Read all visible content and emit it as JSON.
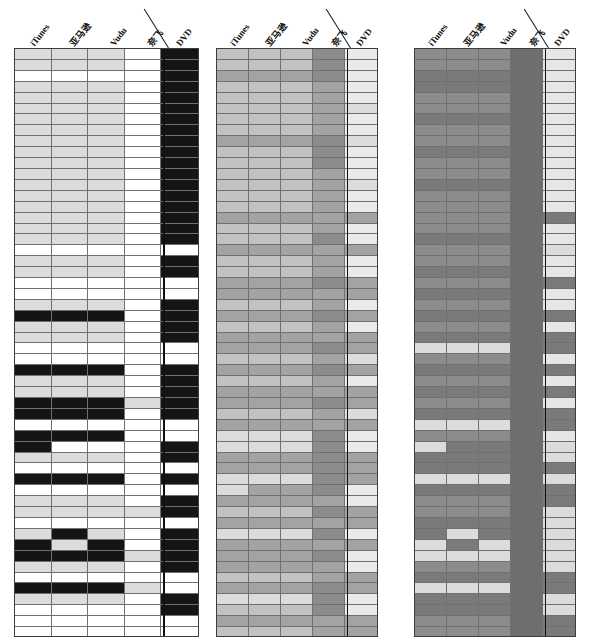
{
  "figure": {
    "type": "heatmap-triptych",
    "panel_count": 3,
    "rows": 54,
    "columns": [
      "iTunes",
      "亚马逊",
      "Vudu",
      "奈飞",
      "DVD"
    ],
    "column_roles": [
      "streaming-itunes",
      "streaming-amazon",
      "streaming-vudu",
      "streaming-netflix",
      "physical-dvd"
    ],
    "divider_between": [
      "奈飞",
      "DVD"
    ],
    "palette": {
      "white": "#ffffff",
      "light": "#dcdcdc",
      "lightmid": "#c9c9c9",
      "mid": "#a8a8a8",
      "middark": "#8e8e8e",
      "dark": "#7b7b7b",
      "darker": "#6e6e6e",
      "black": "#151515",
      "gridline": "#70706e",
      "border": "#3d3d3d"
    }
  },
  "panels": [
    {
      "name": "panel-left",
      "x": 14,
      "width": 185,
      "label_anchor_x": [
        22,
        62,
        102,
        140,
        168
      ],
      "divider_x": 154,
      "cell_palette": [
        "#ffffff",
        "#dcdcdc",
        "#151515"
      ],
      "matrix": [
        [
          1,
          1,
          1,
          0,
          2
        ],
        [
          1,
          1,
          1,
          0,
          2
        ],
        [
          0,
          0,
          0,
          0,
          2
        ],
        [
          1,
          1,
          1,
          0,
          2
        ],
        [
          1,
          1,
          1,
          0,
          2
        ],
        [
          1,
          1,
          1,
          0,
          2
        ],
        [
          1,
          1,
          1,
          0,
          2
        ],
        [
          1,
          1,
          1,
          0,
          2
        ],
        [
          1,
          1,
          1,
          0,
          2
        ],
        [
          1,
          1,
          1,
          0,
          2
        ],
        [
          1,
          1,
          1,
          0,
          2
        ],
        [
          1,
          1,
          1,
          0,
          2
        ],
        [
          1,
          1,
          1,
          0,
          2
        ],
        [
          1,
          1,
          1,
          0,
          2
        ],
        [
          1,
          1,
          1,
          0,
          2
        ],
        [
          1,
          1,
          1,
          0,
          2
        ],
        [
          1,
          1,
          1,
          0,
          2
        ],
        [
          1,
          1,
          1,
          0,
          2
        ],
        [
          0,
          0,
          0,
          0,
          0
        ],
        [
          1,
          1,
          1,
          0,
          2
        ],
        [
          1,
          1,
          1,
          0,
          2
        ],
        [
          0,
          0,
          0,
          0,
          0
        ],
        [
          0,
          0,
          0,
          0,
          0
        ],
        [
          1,
          1,
          1,
          0,
          2
        ],
        [
          2,
          2,
          2,
          0,
          2
        ],
        [
          1,
          1,
          1,
          0,
          2
        ],
        [
          1,
          1,
          1,
          0,
          2
        ],
        [
          0,
          0,
          0,
          0,
          0
        ],
        [
          0,
          0,
          0,
          0,
          0
        ],
        [
          2,
          2,
          2,
          0,
          2
        ],
        [
          1,
          1,
          1,
          0,
          2
        ],
        [
          1,
          1,
          1,
          0,
          2
        ],
        [
          2,
          2,
          2,
          1,
          2
        ],
        [
          2,
          2,
          2,
          0,
          2
        ],
        [
          0,
          0,
          0,
          0,
          0
        ],
        [
          2,
          2,
          2,
          0,
          0
        ],
        [
          2,
          0,
          0,
          0,
          2
        ],
        [
          1,
          1,
          1,
          0,
          2
        ],
        [
          0,
          0,
          0,
          0,
          0
        ],
        [
          2,
          2,
          2,
          0,
          2
        ],
        [
          0,
          0,
          0,
          0,
          0
        ],
        [
          1,
          1,
          1,
          0,
          2
        ],
        [
          1,
          1,
          1,
          1,
          2
        ],
        [
          0,
          0,
          0,
          0,
          0
        ],
        [
          1,
          2,
          1,
          0,
          2
        ],
        [
          2,
          1,
          2,
          0,
          2
        ],
        [
          2,
          2,
          2,
          1,
          2
        ],
        [
          1,
          1,
          1,
          0,
          2
        ],
        [
          0,
          0,
          0,
          0,
          0
        ],
        [
          2,
          2,
          2,
          1,
          0
        ],
        [
          1,
          1,
          1,
          0,
          2
        ],
        [
          0,
          0,
          0,
          0,
          2
        ],
        [
          0,
          0,
          0,
          0,
          0
        ],
        [
          0,
          0,
          0,
          0,
          0
        ]
      ]
    },
    {
      "name": "panel-middle",
      "x": 216,
      "width": 162,
      "label_anchor_x": [
        20,
        56,
        92,
        122,
        146
      ],
      "divider_x": 134,
      "cell_palette": [
        "#dcdcdc",
        "#c2c2c2",
        "#a3a3a3",
        "#8c8c8c",
        "#eaeaea"
      ],
      "matrix": [
        [
          1,
          1,
          1,
          3,
          4
        ],
        [
          1,
          1,
          1,
          3,
          4
        ],
        [
          2,
          2,
          2,
          3,
          4
        ],
        [
          1,
          1,
          1,
          2,
          4
        ],
        [
          1,
          1,
          1,
          2,
          4
        ],
        [
          1,
          1,
          1,
          2,
          0
        ],
        [
          1,
          1,
          1,
          2,
          4
        ],
        [
          1,
          1,
          1,
          2,
          4
        ],
        [
          2,
          2,
          2,
          3,
          0
        ],
        [
          1,
          1,
          1,
          3,
          4
        ],
        [
          1,
          1,
          1,
          3,
          4
        ],
        [
          1,
          1,
          1,
          2,
          4
        ],
        [
          1,
          1,
          1,
          2,
          0
        ],
        [
          1,
          1,
          1,
          2,
          4
        ],
        [
          1,
          1,
          1,
          2,
          4
        ],
        [
          2,
          2,
          2,
          2,
          2
        ],
        [
          1,
          1,
          1,
          2,
          4
        ],
        [
          1,
          1,
          1,
          3,
          4
        ],
        [
          2,
          2,
          2,
          2,
          2
        ],
        [
          1,
          1,
          1,
          2,
          4
        ],
        [
          1,
          1,
          1,
          2,
          4
        ],
        [
          2,
          2,
          2,
          3,
          2
        ],
        [
          2,
          2,
          2,
          2,
          2
        ],
        [
          1,
          1,
          1,
          2,
          4
        ],
        [
          2,
          2,
          2,
          3,
          2
        ],
        [
          1,
          1,
          1,
          2,
          4
        ],
        [
          2,
          2,
          2,
          2,
          2
        ],
        [
          2,
          2,
          2,
          3,
          2
        ],
        [
          1,
          1,
          1,
          2,
          0
        ],
        [
          2,
          2,
          2,
          3,
          2
        ],
        [
          1,
          1,
          1,
          2,
          4
        ],
        [
          2,
          2,
          2,
          2,
          2
        ],
        [
          2,
          2,
          2,
          3,
          2
        ],
        [
          1,
          1,
          1,
          2,
          0
        ],
        [
          2,
          2,
          2,
          2,
          2
        ],
        [
          0,
          0,
          0,
          3,
          4
        ],
        [
          0,
          0,
          0,
          3,
          4
        ],
        [
          2,
          2,
          2,
          3,
          2
        ],
        [
          2,
          2,
          2,
          3,
          2
        ],
        [
          0,
          0,
          0,
          3,
          2
        ],
        [
          0,
          2,
          2,
          3,
          4
        ],
        [
          2,
          2,
          2,
          2,
          4
        ],
        [
          1,
          1,
          1,
          3,
          2
        ],
        [
          2,
          2,
          2,
          2,
          2
        ],
        [
          0,
          0,
          0,
          3,
          4
        ],
        [
          2,
          2,
          2,
          2,
          2
        ],
        [
          2,
          2,
          2,
          3,
          4
        ],
        [
          2,
          2,
          2,
          2,
          4
        ],
        [
          1,
          1,
          1,
          2,
          2
        ],
        [
          2,
          2,
          2,
          3,
          2
        ],
        [
          0,
          0,
          0,
          3,
          4
        ],
        [
          1,
          1,
          1,
          3,
          4
        ],
        [
          2,
          2,
          2,
          2,
          2
        ],
        [
          1,
          1,
          1,
          2,
          2
        ]
      ]
    },
    {
      "name": "panel-right",
      "x": 414,
      "width": 162,
      "label_anchor_x": [
        20,
        56,
        92,
        122,
        146
      ],
      "divider_x": 134,
      "cell_palette": [
        "#dcdcdc",
        "#8c8c8c",
        "#7a7a7a",
        "#6e6e6e",
        "#e6e6e6"
      ],
      "matrix": [
        [
          1,
          1,
          1,
          3,
          4
        ],
        [
          1,
          1,
          1,
          3,
          4
        ],
        [
          2,
          2,
          2,
          3,
          4
        ],
        [
          2,
          2,
          2,
          3,
          4
        ],
        [
          1,
          1,
          1,
          3,
          4
        ],
        [
          1,
          1,
          1,
          3,
          4
        ],
        [
          2,
          2,
          2,
          3,
          4
        ],
        [
          1,
          1,
          1,
          3,
          4
        ],
        [
          1,
          1,
          1,
          3,
          4
        ],
        [
          2,
          2,
          2,
          3,
          4
        ],
        [
          1,
          1,
          1,
          3,
          4
        ],
        [
          1,
          1,
          1,
          3,
          4
        ],
        [
          2,
          2,
          2,
          3,
          4
        ],
        [
          1,
          1,
          1,
          3,
          4
        ],
        [
          1,
          1,
          1,
          3,
          4
        ],
        [
          1,
          1,
          1,
          3,
          2
        ],
        [
          1,
          1,
          1,
          3,
          4
        ],
        [
          2,
          2,
          2,
          3,
          4
        ],
        [
          1,
          1,
          1,
          3,
          0
        ],
        [
          1,
          1,
          1,
          3,
          4
        ],
        [
          2,
          2,
          2,
          3,
          4
        ],
        [
          1,
          1,
          1,
          3,
          2
        ],
        [
          2,
          2,
          2,
          3,
          4
        ],
        [
          1,
          1,
          1,
          3,
          4
        ],
        [
          2,
          2,
          2,
          3,
          2
        ],
        [
          1,
          1,
          1,
          3,
          4
        ],
        [
          2,
          2,
          2,
          3,
          2
        ],
        [
          0,
          0,
          0,
          3,
          2
        ],
        [
          1,
          1,
          1,
          3,
          4
        ],
        [
          2,
          2,
          2,
          3,
          2
        ],
        [
          1,
          1,
          1,
          3,
          4
        ],
        [
          2,
          2,
          2,
          3,
          2
        ],
        [
          1,
          1,
          1,
          3,
          4
        ],
        [
          2,
          2,
          2,
          3,
          2
        ],
        [
          0,
          0,
          0,
          3,
          2
        ],
        [
          1,
          1,
          1,
          3,
          4
        ],
        [
          0,
          2,
          2,
          3,
          0
        ],
        [
          2,
          2,
          2,
          3,
          0
        ],
        [
          2,
          2,
          2,
          3,
          2
        ],
        [
          0,
          0,
          0,
          3,
          0
        ],
        [
          2,
          2,
          2,
          3,
          2
        ],
        [
          1,
          1,
          1,
          3,
          2
        ],
        [
          1,
          1,
          1,
          3,
          0
        ],
        [
          2,
          2,
          2,
          3,
          0
        ],
        [
          2,
          0,
          2,
          3,
          0
        ],
        [
          0,
          2,
          0,
          3,
          0
        ],
        [
          0,
          0,
          0,
          3,
          0
        ],
        [
          1,
          1,
          1,
          3,
          0
        ],
        [
          2,
          2,
          2,
          3,
          2
        ],
        [
          0,
          0,
          0,
          3,
          2
        ],
        [
          2,
          2,
          2,
          3,
          0
        ],
        [
          2,
          2,
          2,
          3,
          0
        ],
        [
          1,
          1,
          1,
          3,
          2
        ],
        [
          1,
          1,
          1,
          3,
          2
        ]
      ]
    }
  ]
}
